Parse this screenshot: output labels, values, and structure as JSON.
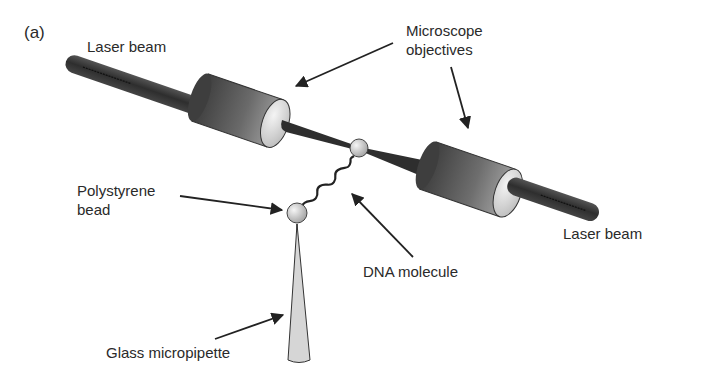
{
  "figure": {
    "panel_label": "(a)",
    "labels": {
      "laser_beam_left": "Laser beam",
      "microscope_objectives_line1": "Microscope",
      "microscope_objectives_line2": "objectives",
      "polystyrene_bead_line1": "Polystyrene",
      "polystyrene_bead_line2": "bead",
      "dna_molecule": "DNA molecule",
      "laser_beam_right": "Laser beam",
      "glass_micropipette": "Glass micropipette"
    },
    "colors": {
      "background": "#ffffff",
      "text": "#2a2a2a",
      "laser_rod": "#3a3a3a",
      "objective_dark": "#4a4a4a",
      "objective_light": "#d8d8d8",
      "bead": "#cfcfcf",
      "pipette": "#d6d6d6",
      "arrow": "#222222"
    }
  }
}
